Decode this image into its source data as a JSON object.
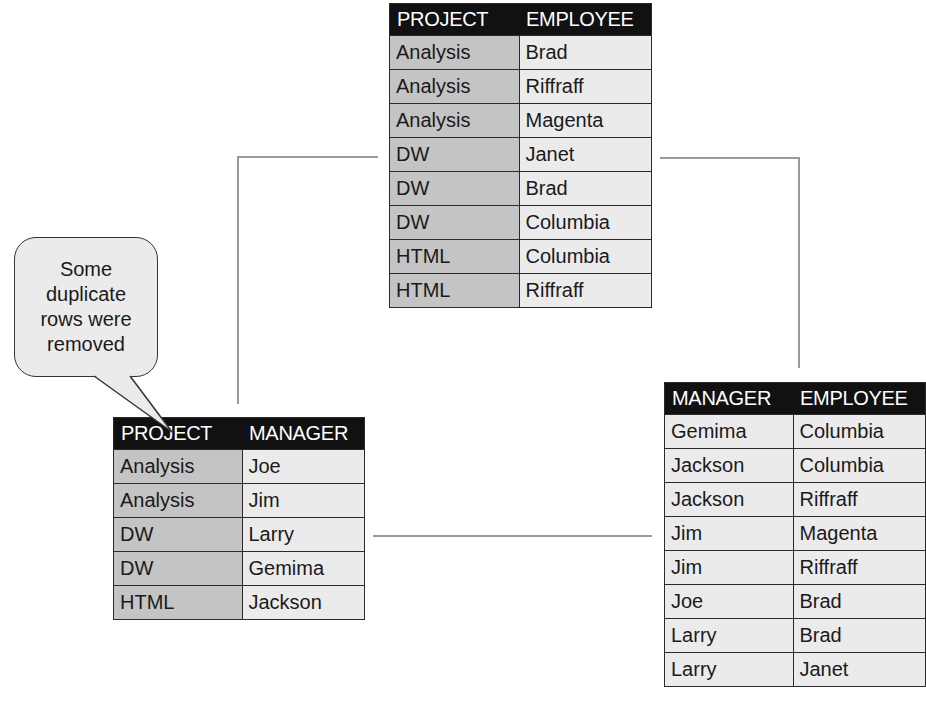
{
  "callout": {
    "text": "Some duplicate rows were removed"
  },
  "tables": {
    "project_employee": {
      "headers": [
        "PROJECT",
        "EMPLOYEE"
      ],
      "rows": [
        [
          "Analysis",
          "Brad"
        ],
        [
          "Analysis",
          "Riffraff"
        ],
        [
          "Analysis",
          "Magenta"
        ],
        [
          "DW",
          "Janet"
        ],
        [
          "DW",
          "Brad"
        ],
        [
          "DW",
          "Columbia"
        ],
        [
          "HTML",
          "Columbia"
        ],
        [
          "HTML",
          "Riffraff"
        ]
      ]
    },
    "project_manager": {
      "headers": [
        "PROJECT",
        "MANAGER"
      ],
      "rows": [
        [
          "Analysis",
          "Joe"
        ],
        [
          "Analysis",
          "Jim"
        ],
        [
          "DW",
          "Larry"
        ],
        [
          "DW",
          "Gemima"
        ],
        [
          "HTML",
          "Jackson"
        ]
      ]
    },
    "manager_employee": {
      "headers": [
        "MANAGER",
        "EMPLOYEE"
      ],
      "rows": [
        [
          "Gemima",
          "Columbia"
        ],
        [
          "Jackson",
          "Columbia"
        ],
        [
          "Jackson",
          "Riffraff"
        ],
        [
          "Jim",
          "Magenta"
        ],
        [
          "Jim",
          "Riffraff"
        ],
        [
          "Joe",
          "Brad"
        ],
        [
          "Larry",
          "Brad"
        ],
        [
          "Larry",
          "Janet"
        ]
      ]
    }
  },
  "colors": {
    "header_bg": "#111111",
    "key_column_bg": "#c4c4c4",
    "cell_bg": "#ebebeb",
    "connector": "#9a9a9a"
  }
}
